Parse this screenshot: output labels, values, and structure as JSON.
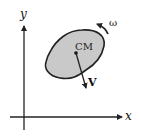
{
  "diagram": {
    "axes": {
      "x_label": "x",
      "y_label": "y"
    },
    "body": {
      "label": "CM",
      "fill_color": "#c9c9c9",
      "stroke_color": "#222222"
    },
    "velocity": {
      "label": "V"
    },
    "rotation": {
      "label": "ω"
    }
  }
}
